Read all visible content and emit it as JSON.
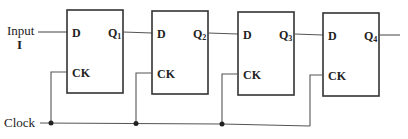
{
  "diagram": {
    "type": "shift-register",
    "input": {
      "label": "Input",
      "symbol": "I"
    },
    "clock": {
      "label": "Clock"
    },
    "flipflops": [
      {
        "id": "ff1",
        "d_label": "D",
        "ck_label": "CK",
        "q_label": "Q",
        "q_sub": "1"
      },
      {
        "id": "ff2",
        "d_label": "D",
        "ck_label": "CK",
        "q_label": "Q",
        "q_sub": "2"
      },
      {
        "id": "ff3",
        "d_label": "D",
        "ck_label": "CK",
        "q_label": "Q",
        "q_sub": "3"
      },
      {
        "id": "ff4",
        "d_label": "D",
        "ck_label": "CK",
        "q_label": "Q",
        "q_sub": "4"
      }
    ],
    "colors": {
      "stroke": "#333333",
      "wire": "#555555",
      "background": "#ffffff"
    }
  }
}
